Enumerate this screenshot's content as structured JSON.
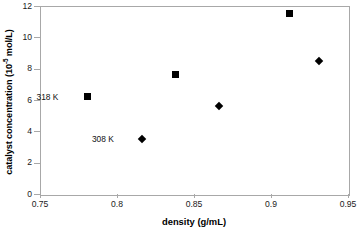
{
  "chart_data": {
    "type": "scatter",
    "title": "",
    "xlabel": "density (g/mL)",
    "ylabel": "catalyst concentration (10 -5 mol/L)",
    "ylabel_prefix": "catalyst concentration (10",
    "ylabel_sup": "-5",
    "ylabel_suffix": " mol/L)",
    "xlim": [
      0.75,
      0.95
    ],
    "ylim": [
      0,
      12
    ],
    "xticks": [
      "0.75",
      "0.8",
      "0.85",
      "0.9",
      "0.95"
    ],
    "xtick_values": [
      0.75,
      0.8,
      0.85,
      0.9,
      0.95
    ],
    "yticks": [
      "0",
      "2",
      "4",
      "6",
      "8",
      "10",
      "12"
    ],
    "ytick_values": [
      0,
      2,
      4,
      6,
      8,
      10,
      12
    ],
    "grid": false,
    "legend_position": "inline-annotations",
    "series": [
      {
        "name": "318 K",
        "marker": "square",
        "color": "#000000",
        "points": [
          {
            "x": 0.781,
            "y": 6.2
          },
          {
            "x": 0.838,
            "y": 7.6
          },
          {
            "x": 0.912,
            "y": 11.5
          }
        ]
      },
      {
        "name": "308 K",
        "marker": "diamond",
        "color": "#000000",
        "points": [
          {
            "x": 0.816,
            "y": 3.5
          },
          {
            "x": 0.866,
            "y": 5.6
          },
          {
            "x": 0.931,
            "y": 8.5
          }
        ]
      }
    ],
    "annotations": [
      {
        "text": "318 K",
        "x": 0.762,
        "y": 6.2
      },
      {
        "text": "308 K",
        "x": 0.798,
        "y": 3.5
      }
    ]
  }
}
